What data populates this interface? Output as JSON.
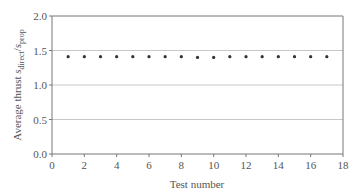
{
  "chart_data": {
    "type": "scatter",
    "title": "",
    "xlabel": "Test number",
    "ylabel": "Average thrust s_direct/s_prop",
    "ylabel_parts": {
      "main": "Average thrust ",
      "s1": "s",
      "sub1": "direct",
      "slash": "/",
      "s2": "s",
      "sub2": "prop"
    },
    "xlim": [
      0,
      18
    ],
    "ylim": [
      0,
      2.0
    ],
    "xticks": [
      0,
      2,
      4,
      6,
      8,
      10,
      12,
      14,
      16,
      18
    ],
    "yticks": [
      0.0,
      0.5,
      1.0,
      1.5,
      2.0
    ],
    "ytick_labels": [
      "0.0",
      "0.5",
      "1.0",
      "1.5",
      "2.0"
    ],
    "grid": {
      "horizontal": true,
      "vertical": false
    },
    "legend": null,
    "x": [
      1,
      2,
      3,
      4,
      5,
      6,
      7,
      8,
      9,
      10,
      11,
      12,
      13,
      14,
      15,
      16,
      17
    ],
    "y": [
      1.41,
      1.41,
      1.41,
      1.41,
      1.41,
      1.41,
      1.41,
      1.41,
      1.4,
      1.4,
      1.41,
      1.41,
      1.41,
      1.41,
      1.41,
      1.41,
      1.41
    ],
    "colors": {
      "marker": "#333333",
      "grid": "#c8c8c8",
      "axis": "#777777",
      "text": "#555555"
    }
  }
}
